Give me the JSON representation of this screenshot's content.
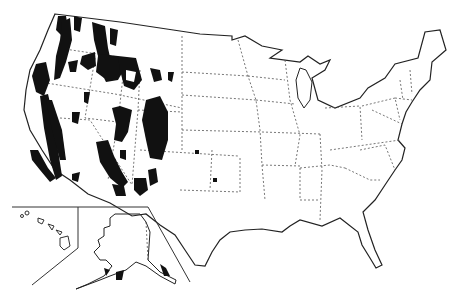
{
  "map": {
    "type": "choropleth-outline",
    "region": "United States",
    "insets": [
      "Alaska",
      "Hawaii"
    ],
    "colors": {
      "background": "#ffffff",
      "outline": "#222222",
      "state_border": "#555555",
      "shaded": "#111111"
    },
    "legend": null,
    "shaded_regions": [
      "Cascade Range",
      "Sierra Nevada",
      "Coast Ranges",
      "Northern Rockies",
      "Yellowstone area",
      "Wasatch Range",
      "Uinta Mountains",
      "Colorado Rockies",
      "Arizona Mogollon Rim",
      "Black Hills",
      "Southern California ranges"
    ]
  }
}
